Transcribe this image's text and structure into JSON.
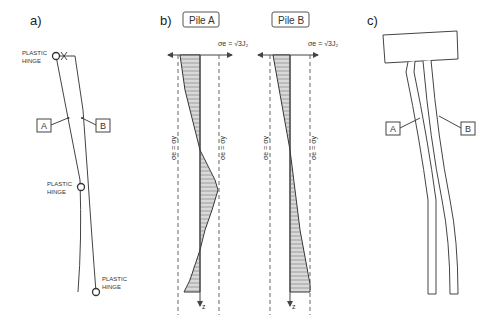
{
  "panels": {
    "a": {
      "label": "a)",
      "hinge_labels": [
        {
          "line1": "PLASTIC",
          "line2": "HINGE"
        },
        {
          "line1": "PLASTIC",
          "line2": "HINGE"
        },
        {
          "line1": "PLASTIC",
          "line2": "HINGE"
        }
      ],
      "pile_labels": {
        "a": "A",
        "b": "B"
      }
    },
    "b": {
      "label": "b)",
      "pile_a": {
        "title": "Pile A",
        "formula": "σe = √3J₂",
        "yield_left": "σe = σy",
        "yield_right": "σe = σy",
        "depth_axis": "z"
      },
      "pile_b": {
        "title": "Pile B",
        "formula": "σe = √3J₂",
        "yield_left": "σe = σy",
        "yield_right": "σe = σy",
        "depth_axis": "z"
      }
    },
    "c": {
      "label": "c)",
      "pile_labels": {
        "a": "A",
        "b": "B"
      }
    }
  },
  "colors": {
    "line": "#444444",
    "hatch": "#777777",
    "background": "#ffffff"
  }
}
